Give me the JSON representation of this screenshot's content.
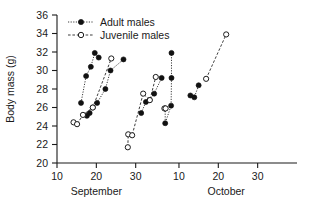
{
  "chart_data": {
    "type": "scatter",
    "title": "",
    "xlabel": "",
    "ylabel": "Body mass (g)",
    "ylim": [
      20,
      36
    ],
    "yticks": [
      20,
      22,
      24,
      26,
      28,
      30,
      32,
      34,
      36
    ],
    "xlim": [
      10,
      71
    ],
    "xtick_positions": [
      10,
      20,
      30,
      41,
      51,
      61
    ],
    "xtick_labels": [
      "10",
      "20",
      "30",
      "10",
      "20",
      "30"
    ],
    "x_group_labels": [
      {
        "label": "September",
        "at": 20
      },
      {
        "label": "October",
        "at": 53
      }
    ],
    "grid": false,
    "legend_position": "top-left",
    "legend": [
      {
        "name": "Adult males",
        "marker": "filled-circle",
        "line": "dotted"
      },
      {
        "name": "Juvenile males",
        "marker": "open-circle",
        "line": "dashed"
      }
    ],
    "series": [
      {
        "name": "Adult males",
        "marker": "filled-circle",
        "groups": [
          {
            "points": [
              [
                16.1,
                26.5
              ],
              [
                17.4,
                29.4
              ],
              [
                18.6,
                30.4
              ],
              [
                19.6,
                31.9
              ],
              [
                20.6,
                31.4
              ]
            ]
          },
          {
            "points": [
              [
                17.6,
                25.1
              ],
              [
                18.3,
                25.4
              ],
              [
                19.1,
                26.0
              ],
              [
                20.2,
                26.5
              ],
              [
                22.3,
                28.0
              ],
              [
                23.6,
                30.0
              ],
              [
                26.9,
                31.2
              ]
            ]
          },
          {
            "points": [
              [
                31.4,
                25.4
              ],
              [
                32.6,
                26.6
              ],
              [
                33.5,
                26.8
              ],
              [
                34.7,
                27.5
              ],
              [
                36.6,
                29.2
              ]
            ]
          },
          {
            "points": [
              [
                37.5,
                25.9
              ],
              [
                37.5,
                24.3
              ],
              [
                39.0,
                26.2
              ],
              [
                39.1,
                29.2
              ],
              [
                39.1,
                31.9
              ]
            ]
          },
          {
            "points": [
              [
                43.9,
                27.3
              ],
              [
                44.9,
                27.1
              ],
              [
                46.0,
                28.4
              ]
            ]
          }
        ]
      },
      {
        "name": "Juvenile males",
        "marker": "open-circle",
        "groups": [
          {
            "points": [
              [
                14.2,
                24.4
              ],
              [
                15.1,
                24.2
              ],
              [
                16.6,
                25.2
              ],
              [
                19.1,
                26.0
              ],
              [
                23.8,
                31.3
              ]
            ]
          },
          {
            "points": [
              [
                28.0,
                21.7
              ],
              [
                28.1,
                23.1
              ],
              [
                29.1,
                23.0
              ],
              [
                31.9,
                27.5
              ],
              [
                33.6,
                26.8
              ],
              [
                35.1,
                29.3
              ]
            ]
          },
          {
            "points": [
              [
                37.3,
                25.9
              ],
              [
                37.6,
                25.9
              ]
            ]
          },
          {
            "points": [
              [
                47.9,
                29.1
              ],
              [
                53.0,
                33.9
              ]
            ]
          }
        ]
      }
    ]
  }
}
